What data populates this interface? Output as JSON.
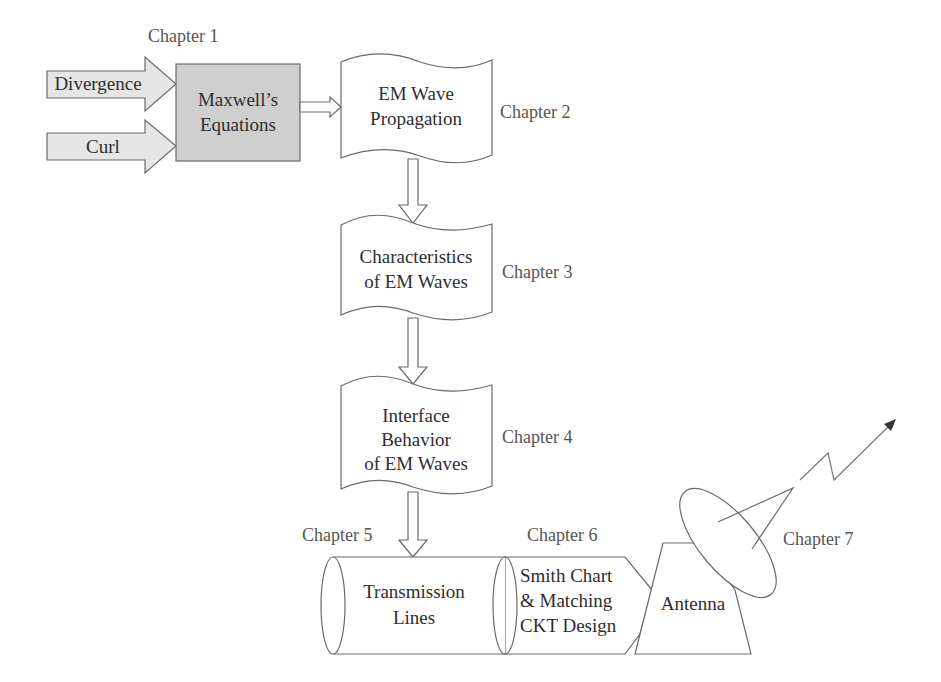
{
  "diagram": {
    "colors": {
      "maxwell_fill": "#cfcfcf",
      "input_arrow_fill": "#e6e6e6",
      "outline": "#6a6a6a",
      "shape_text": "#2e2e2e",
      "chapter_text": "#555555"
    },
    "inputs": {
      "divergence": "Divergence",
      "curl": "Curl"
    },
    "nodes": {
      "maxwell": {
        "lines": [
          "Maxwell’s",
          "Equations"
        ],
        "chapter": "Chapter 1"
      },
      "propagation": {
        "lines": [
          "EM Wave",
          "Propagation"
        ],
        "chapter": "Chapter 2"
      },
      "characteristics": {
        "lines": [
          "Characteristics",
          "of EM Waves"
        ],
        "chapter": "Chapter 3"
      },
      "interface": {
        "lines": [
          "Interface",
          "Behavior",
          "of EM Waves"
        ],
        "chapter": "Chapter 4"
      },
      "transmission": {
        "lines": [
          "Transmission",
          "Lines"
        ],
        "chapter": "Chapter 5"
      },
      "smith": {
        "lines": [
          "Smith Chart",
          "& Matching",
          "CKT Design"
        ],
        "chapter": "Chapter 6"
      },
      "antenna": {
        "lines": [
          "Antenna"
        ],
        "chapter": "Chapter 7"
      }
    },
    "edges": [
      {
        "from": "divergence",
        "to": "maxwell"
      },
      {
        "from": "curl",
        "to": "maxwell"
      },
      {
        "from": "maxwell",
        "to": "propagation"
      },
      {
        "from": "propagation",
        "to": "characteristics"
      },
      {
        "from": "characteristics",
        "to": "interface"
      },
      {
        "from": "interface",
        "to": "transmission"
      },
      {
        "from": "transmission",
        "to": "smith"
      },
      {
        "from": "smith",
        "to": "antenna"
      },
      {
        "from": "antenna",
        "to": "radiation"
      }
    ]
  }
}
